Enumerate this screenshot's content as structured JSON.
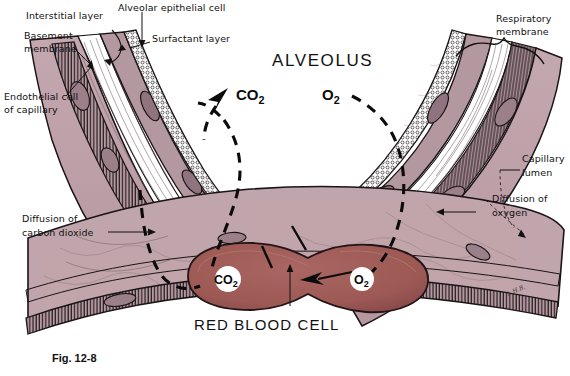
{
  "figure": {
    "caption": "Fig. 12-8",
    "title": "ALVEOLUS",
    "signature": "L.H.B."
  },
  "labels": {
    "interstitial_layer": "Interstitial layer",
    "basement_membrane_l1": "Basement",
    "basement_membrane_l2": "membrane",
    "endothelial_cell_l1": "Endothelial cell",
    "endothelial_cell_l2": "of capillary",
    "alveolar_epithelial_cell": "Alveolar epithelial cell",
    "surfactant_layer": "Surfactant layer",
    "respiratory_membrane_l1": "Respiratory",
    "respiratory_membrane_l2": "membrane",
    "capillary_lumen_l1": "Capillary",
    "capillary_lumen_l2": "lumen",
    "diffusion_co2_l1": "Diffusion of",
    "diffusion_co2_l2": "carbon dioxide",
    "diffusion_o2_l1": "Diffusion of",
    "diffusion_o2_l2": "oxygen",
    "red_blood_cell": "RED BLOOD CELL"
  },
  "gases": {
    "co2_alveolus_main": "CO",
    "co2_alveolus_sub": "2",
    "o2_alveolus_main": "O",
    "o2_alveolus_sub": "2",
    "co2_rbc_main": "CO",
    "co2_rbc_sub": "2",
    "o2_rbc_main": "O",
    "o2_rbc_sub": "2"
  },
  "colors": {
    "tissue_mauve": "#bfa2aa",
    "tissue_mauve_dark": "#a98d97",
    "epithelium": "#b498a0",
    "rbc_red": "#9d5a55",
    "rbc_red_dark": "#8a4b48",
    "outline": "#1a1416",
    "background": "#ffffff",
    "label_text": "#111111"
  }
}
